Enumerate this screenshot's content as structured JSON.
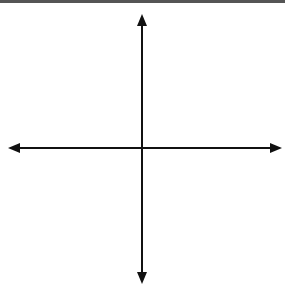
{
  "chart_data": {
    "type": "scatter",
    "title": "",
    "xlabel": "x",
    "ylabel": "y",
    "xlim": [
      -8,
      8
    ],
    "ylim": [
      -8,
      8
    ],
    "grid": true,
    "x_ticks": [
      "-6",
      "-5",
      "-4",
      "-3",
      "-2",
      "-1",
      "1",
      "2",
      "3",
      "4",
      "5",
      "6"
    ],
    "y_ticks": [
      "6",
      "5",
      "4",
      "3",
      "2",
      "1",
      "-1",
      "-2",
      "-3",
      "-4",
      "-5",
      "-6"
    ],
    "points": [
      {
        "name": "A",
        "x": 3,
        "y": 5,
        "label": "A(3, 5)"
      },
      {
        "name": "B",
        "x": 6,
        "y": 2,
        "label": "B(6, 2)"
      },
      {
        "name": "C",
        "x": -3,
        "y": 2,
        "label": "C(−3, 2)"
      },
      {
        "name": "D",
        "x": -5,
        "y": -3,
        "label": "D(−5, −3)"
      },
      {
        "name": "E",
        "x": 2,
        "y": -5,
        "label": "E(2, −5)"
      }
    ]
  },
  "axes": {
    "x_label": "x",
    "y_label": "y"
  },
  "colors": {
    "grid": "#bdbdbd",
    "axis": "#111111",
    "point": "#111111"
  }
}
